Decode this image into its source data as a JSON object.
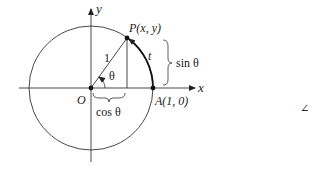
{
  "diagram": {
    "type": "unit-circle",
    "axes": {
      "x_label": "x",
      "y_label": "y"
    },
    "points": {
      "origin": "O",
      "point_p": "P(x, y)",
      "point_a": "A(1, 0)"
    },
    "labels": {
      "radius": "1",
      "angle": "θ",
      "arc": "t",
      "sin": "sin θ",
      "cos": "cos θ"
    },
    "stray_symbol": "∠",
    "colors": {
      "stroke": "#222222",
      "background": "#ffffff"
    }
  }
}
